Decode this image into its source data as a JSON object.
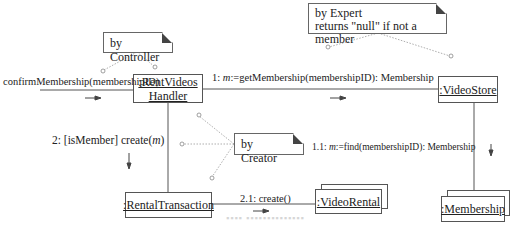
{
  "diagram": {
    "type": "uml-communication-diagram",
    "objects": [
      {
        "id": "handler",
        "label_line1": ":RentVideos",
        "label_line2": "Handler",
        "multiobject": false
      },
      {
        "id": "videostore",
        "label": ":VideoStore",
        "multiobject": false
      },
      {
        "id": "membership",
        "label": ":Membership",
        "multiobject": true
      },
      {
        "id": "rentaltransaction",
        "label": ":RentalTransaction",
        "multiobject": false
      },
      {
        "id": "videorental",
        "label": ":VideoRental",
        "multiobject": true
      }
    ],
    "notes": {
      "controller": {
        "text": "by Controller"
      },
      "expert": {
        "line1": "by Expert",
        "line2": "returns \"null\" if not a member"
      },
      "creator": {
        "text": "by Creator"
      }
    },
    "messages": {
      "incoming": {
        "text": "confirmMembership(membershipID)",
        "direction": "right"
      },
      "m1": {
        "prefix": "1: ",
        "var": "m",
        "rest": ":=getMembership(membershipID): Membership",
        "direction": "right"
      },
      "m1_1": {
        "prefix": "1.1: ",
        "var": "m",
        "rest": ":=find(membershipID): Membership",
        "direction": "down"
      },
      "m2": {
        "prefix": "2: [isMember] create(",
        "var": "m",
        "rest": ")",
        "direction": "down"
      },
      "m2_1": {
        "text": "2.1: create()",
        "direction": "right"
      }
    },
    "links": [
      {
        "from": "actor",
        "to": "handler"
      },
      {
        "from": "handler",
        "to": "videostore"
      },
      {
        "from": "videostore",
        "to": "membership"
      },
      {
        "from": "handler",
        "to": "rentaltransaction"
      },
      {
        "from": "rentaltransaction",
        "to": "videorental"
      }
    ],
    "caption": "图 — 协作图 (faint, illegible)"
  },
  "colors": {
    "line": "#555555",
    "note_line": "#888888",
    "fold": "#444444"
  }
}
